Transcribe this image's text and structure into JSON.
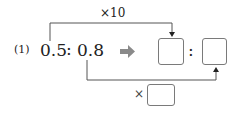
{
  "problem": {
    "number_label": "(1)",
    "left_term": "0.5",
    "separator": ":",
    "right_term": "0.8",
    "top_multiplier": "×10",
    "bottom_multiplier_prefix": "×",
    "arrow_icon": "right-arrow",
    "answer_boxes": [
      {
        "value": ""
      },
      {
        "value": ""
      }
    ],
    "answer_separator": ":",
    "bottom_multiplier_box": {
      "value": ""
    }
  }
}
